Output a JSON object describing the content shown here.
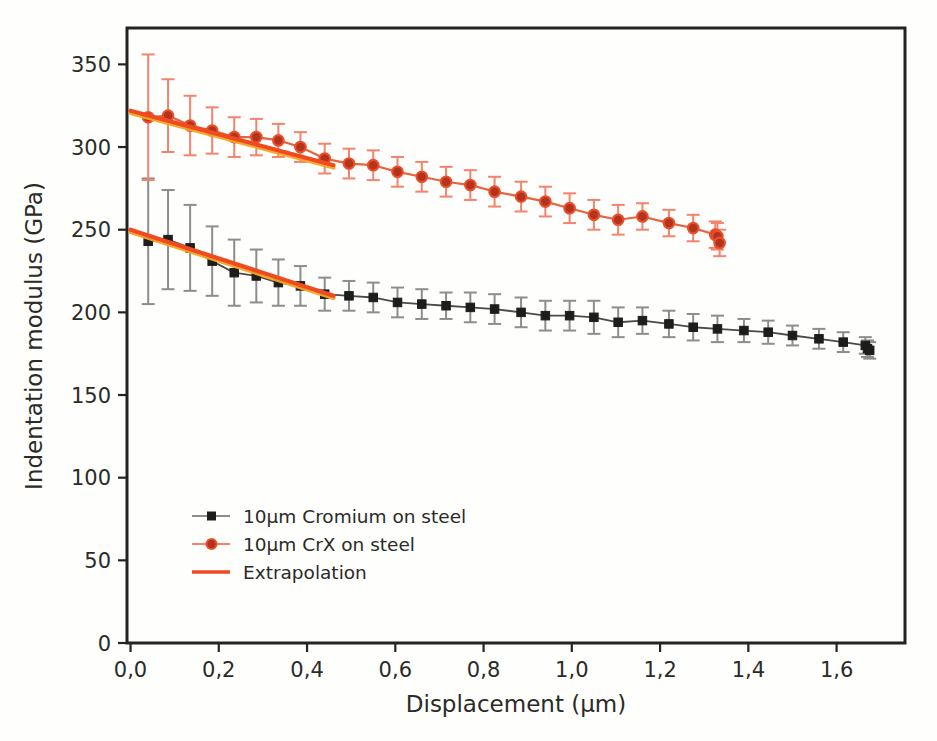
{
  "figure": {
    "background_color": "#fefefd",
    "frame_color": "#23231f",
    "width": 937,
    "height": 741
  },
  "axes": {
    "x_title": "Displacement (µm)",
    "y_title": "Indentation modulus (GPa)",
    "x_ticks": [
      "0,0",
      "0,2",
      "0,4",
      "0,6",
      "0,8",
      "1,0",
      "1,2",
      "1,4",
      "1,6"
    ],
    "y_ticks": [
      "0",
      "50",
      "100",
      "150",
      "200",
      "250",
      "300",
      "350"
    ],
    "x_tick_values": [
      0.0,
      0.2,
      0.4,
      0.6,
      0.8,
      1.0,
      1.2,
      1.4,
      1.6
    ],
    "y_tick_values": [
      0,
      50,
      100,
      150,
      200,
      250,
      300,
      350
    ],
    "x_lim": [
      -0.008,
      1.755
    ],
    "y_lim": [
      0,
      372
    ],
    "decimal_separator": ","
  },
  "legend": {
    "position": "inside-lower-left",
    "items": [
      {
        "label": "10µm Cromium on steel",
        "marker": "square",
        "color": "#1d1d1b",
        "errorbar_color": "#8d8d89",
        "style": "line-marker"
      },
      {
        "label": "10µm CrX on steel",
        "marker": "circle",
        "color": "#b5331c",
        "errorbar_color": "#f4836d",
        "style": "line-marker"
      },
      {
        "label": "Extrapolation",
        "marker": "none",
        "color": "#f04a22",
        "errorbar_color": "",
        "style": "line"
      }
    ]
  },
  "colors": {
    "chromium_marker": "#1d1d1b",
    "chromium_line": "#4a4a46",
    "chromium_error": "#8d8d89",
    "crx_marker": "#b5331c",
    "crx_marker_edge": "#e8502c",
    "crx_line": "#e8633f",
    "crx_error": "#f4836d",
    "extrapolation": "#f04a22",
    "extrapolation_shadow": "#f5a623",
    "frame": "#23231f",
    "text": "#2b2b26"
  },
  "chart_data": {
    "type": "line",
    "title": "",
    "xlabel": "Displacement (µm)",
    "ylabel": "Indentation modulus (GPa)",
    "xlim": [
      -0.008,
      1.755
    ],
    "ylim": [
      0,
      372
    ],
    "grid": false,
    "legend_position": "lower left (inside axes)",
    "series": [
      {
        "name": "10µm Cromium on steel",
        "marker": "square",
        "color": "#1d1d1b",
        "x": [
          0.04,
          0.085,
          0.135,
          0.185,
          0.235,
          0.285,
          0.335,
          0.385,
          0.44,
          0.495,
          0.55,
          0.605,
          0.66,
          0.715,
          0.77,
          0.825,
          0.885,
          0.94,
          0.995,
          1.05,
          1.105,
          1.16,
          1.22,
          1.275,
          1.33,
          1.39,
          1.445,
          1.5,
          1.56,
          1.615,
          1.665,
          1.67,
          1.675
        ],
        "y": [
          243,
          244,
          239,
          231,
          224,
          222,
          218,
          216,
          211,
          210,
          209,
          206,
          205,
          204,
          203,
          202,
          200,
          198,
          198,
          197,
          194,
          195,
          193,
          191,
          190,
          189,
          188,
          186,
          184,
          182,
          180,
          178,
          177
        ],
        "yerr": [
          38,
          30,
          26,
          21,
          20,
          16,
          14,
          12,
          10,
          9,
          9,
          9,
          9,
          8,
          9,
          9,
          9,
          9,
          9,
          10,
          9,
          8,
          8,
          8,
          8,
          7,
          7,
          6,
          6,
          6,
          5,
          5,
          5
        ]
      },
      {
        "name": "10µm CrX on steel",
        "marker": "circle",
        "color": "#b5331c",
        "x": [
          0.04,
          0.085,
          0.135,
          0.185,
          0.235,
          0.285,
          0.335,
          0.385,
          0.44,
          0.495,
          0.55,
          0.605,
          0.66,
          0.715,
          0.77,
          0.825,
          0.885,
          0.94,
          0.995,
          1.05,
          1.105,
          1.16,
          1.22,
          1.275,
          1.325,
          1.33,
          1.335
        ],
        "y": [
          318,
          319,
          313,
          310,
          306,
          306,
          304,
          300,
          293,
          290,
          289,
          285,
          282,
          279,
          277,
          273,
          270,
          267,
          263,
          259,
          256,
          258,
          254,
          251,
          247,
          246,
          242
        ],
        "yerr": [
          38,
          22,
          18,
          14,
          12,
          11,
          10,
          9,
          9,
          9,
          9,
          9,
          9,
          9,
          9,
          9,
          9,
          9,
          9,
          9,
          9,
          8,
          8,
          8,
          8,
          8,
          8
        ]
      }
    ],
    "extrapolation_lines": [
      {
        "name": "Extrapolation (CrX)",
        "x": [
          0.0,
          0.46
        ],
        "y": [
          322,
          289
        ],
        "color": "#f04a22"
      },
      {
        "name": "Extrapolation (Cromium)",
        "x": [
          0.0,
          0.46
        ],
        "y": [
          250,
          210
        ],
        "color": "#f04a22"
      }
    ]
  }
}
